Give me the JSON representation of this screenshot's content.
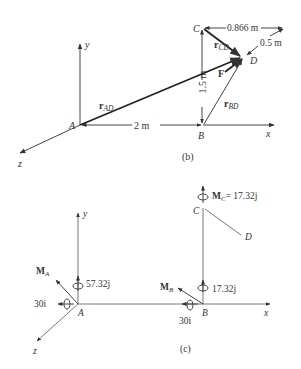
{
  "figure_b": {
    "caption": "(b)",
    "points": {
      "A": "A",
      "B": "B",
      "C": "C",
      "D": "D"
    },
    "axes": {
      "x": "x",
      "y": "y",
      "z": "z"
    },
    "vectors": {
      "r_AD": {
        "main": "r",
        "sub": "AD"
      },
      "r_CD": {
        "main": "r",
        "sub": "CD"
      },
      "r_BD": {
        "main": "r",
        "sub": "BD"
      },
      "F": "F"
    },
    "dimensions": {
      "AB": "2 m",
      "BC": "1.5 m",
      "C_horizontal": "0.866 m",
      "D_depth": "0.5 m"
    }
  },
  "figure_c": {
    "caption": "(c)",
    "points": {
      "A": "A",
      "B": "B",
      "C": "C",
      "D": "D"
    },
    "axes": {
      "x": "x",
      "y": "y",
      "z": "z"
    },
    "moments": {
      "M_A": {
        "main": "M",
        "sub": "A"
      },
      "M_B": {
        "main": "M",
        "sub": "B"
      },
      "M_C": {
        "main": "M",
        "sub": "C",
        "value": "= 17.32j"
      },
      "A_j": "57.32j",
      "A_i": "30i",
      "B_j": "17.32j",
      "B_i": "30i"
    }
  },
  "colors": {
    "ink": "#333333",
    "background": "#ffffff"
  }
}
